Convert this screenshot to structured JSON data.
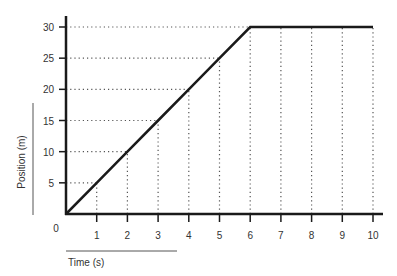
{
  "chart_data": {
    "type": "line",
    "title": "",
    "xlabel": "Time (s)",
    "ylabel": "Position (m)",
    "xlim": [
      0,
      10
    ],
    "ylim": [
      0,
      30
    ],
    "x_ticks": [
      1,
      2,
      3,
      4,
      5,
      6,
      7,
      8,
      9,
      10
    ],
    "y_ticks": [
      5,
      10,
      15,
      20,
      25,
      30
    ],
    "origin_label": "0",
    "grid": "dotted guide lines",
    "legend": "none",
    "series": [
      {
        "name": "Position",
        "x": [
          0,
          1,
          2,
          3,
          4,
          5,
          6,
          7,
          8,
          9,
          10
        ],
        "y": [
          0,
          5,
          10,
          15,
          20,
          25,
          30,
          30,
          30,
          30,
          30
        ]
      }
    ]
  },
  "colors": {
    "line": "#1a1a1a",
    "axis": "#1a1a1a",
    "grid": "#555555",
    "text": "#333333"
  }
}
